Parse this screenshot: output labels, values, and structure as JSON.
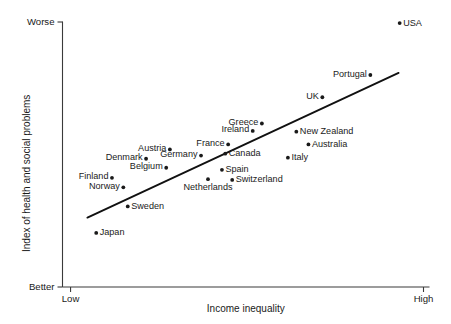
{
  "chart_data": {
    "type": "scatter",
    "title": "",
    "xlabel": "Income inequality",
    "ylabel": "Index of health and social problems",
    "x_tick_labels": [
      "Low",
      "High"
    ],
    "y_tick_labels": [
      "Better",
      "Worse"
    ],
    "y_top_label": "Worse",
    "y_bottom_label": "Better",
    "x_left_label": "Low",
    "x_right_label": "High",
    "grid": false,
    "legend": "none",
    "xlim": [
      0,
      1
    ],
    "ylim": [
      0,
      1
    ],
    "trend_line": {
      "label": "best-fit line",
      "x1": 0.068,
      "y1": 0.262,
      "x2": 0.917,
      "y2": 0.808
    },
    "points": [
      {
        "name": "USA",
        "x": 0.92,
        "y": 0.996,
        "label_pos": "right"
      },
      {
        "name": "Portugal",
        "x": 0.84,
        "y": 0.8,
        "label_pos": "left"
      },
      {
        "name": "UK",
        "x": 0.709,
        "y": 0.716,
        "label_pos": "left"
      },
      {
        "name": "Greece",
        "x": 0.544,
        "y": 0.617,
        "label_pos": "left"
      },
      {
        "name": "Ireland",
        "x": 0.519,
        "y": 0.589,
        "label_pos": "left"
      },
      {
        "name": "New Zealand",
        "x": 0.638,
        "y": 0.586,
        "label_pos": "right"
      },
      {
        "name": "France",
        "x": 0.452,
        "y": 0.538,
        "label_pos": "left"
      },
      {
        "name": "Australia",
        "x": 0.671,
        "y": 0.538,
        "label_pos": "right"
      },
      {
        "name": "Austria",
        "x": 0.293,
        "y": 0.519,
        "label_pos": "left"
      },
      {
        "name": "Canada",
        "x": 0.444,
        "y": 0.503,
        "label_pos": "right"
      },
      {
        "name": "Germany",
        "x": 0.378,
        "y": 0.496,
        "label_pos": "left"
      },
      {
        "name": "Italy",
        "x": 0.615,
        "y": 0.488,
        "label_pos": "right"
      },
      {
        "name": "Denmark",
        "x": 0.228,
        "y": 0.484,
        "label_pos": "left"
      },
      {
        "name": "Belgium",
        "x": 0.283,
        "y": 0.45,
        "label_pos": "left"
      },
      {
        "name": "Spain",
        "x": 0.435,
        "y": 0.442,
        "label_pos": "right"
      },
      {
        "name": "Switzerland",
        "x": 0.463,
        "y": 0.404,
        "label_pos": "right"
      },
      {
        "name": "Finland",
        "x": 0.135,
        "y": 0.412,
        "label_pos": "left"
      },
      {
        "name": "Netherlands",
        "x": 0.397,
        "y": 0.407,
        "label_pos": "below"
      },
      {
        "name": "Norway",
        "x": 0.166,
        "y": 0.376,
        "label_pos": "left"
      },
      {
        "name": "Sweden",
        "x": 0.178,
        "y": 0.304,
        "label_pos": "right"
      },
      {
        "name": "Japan",
        "x": 0.092,
        "y": 0.204,
        "label_pos": "right"
      }
    ]
  }
}
